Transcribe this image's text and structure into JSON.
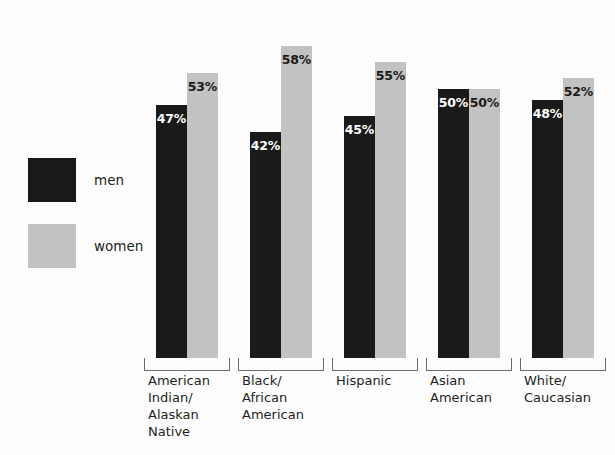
{
  "chart_data": {
    "type": "bar",
    "title": "",
    "xlabel": "",
    "ylabel": "",
    "ylim": [
      0,
      65
    ],
    "grid": false,
    "legend_position": "left",
    "orientation": "vertical",
    "grouping": "grouped",
    "categories": [
      "American Indian/ Alaskan Native",
      "Black/ African American",
      "Hispanic",
      "Asian American",
      "White/ Caucasian"
    ],
    "series": [
      {
        "name": "men",
        "color": "#1a1a1a",
        "values": [
          47,
          42,
          45,
          50,
          48
        ]
      },
      {
        "name": "women",
        "color": "#c2c2c2",
        "values": [
          53,
          58,
          55,
          50,
          52
        ]
      }
    ],
    "data_labels": [
      [
        "47%",
        "53%"
      ],
      [
        "42%",
        "58%"
      ],
      [
        "45%",
        "55%"
      ],
      [
        "50%",
        "50%"
      ],
      [
        "48%",
        "52%"
      ]
    ]
  },
  "legend": {
    "items": [
      {
        "label": "men",
        "color": "#1a1a1a"
      },
      {
        "label": "women",
        "color": "#c2c2c2"
      }
    ]
  },
  "axis": {
    "category_labels": [
      {
        "lines": [
          "American",
          "Indian/",
          "Alaskan",
          "Native"
        ]
      },
      {
        "lines": [
          "Black/",
          "African",
          "American"
        ]
      },
      {
        "lines": [
          "Hispanic"
        ]
      },
      {
        "lines": [
          "Asian",
          "American"
        ]
      },
      {
        "lines": [
          "White/",
          "Caucasian"
        ]
      }
    ]
  },
  "title_sliver": {
    "text": ""
  }
}
